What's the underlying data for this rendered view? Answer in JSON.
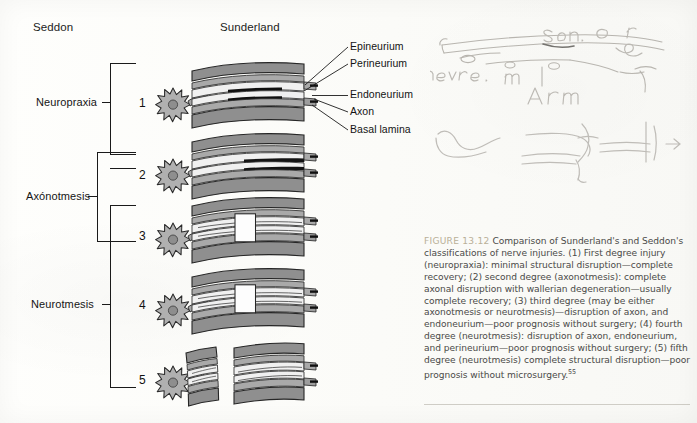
{
  "figure": {
    "headers": {
      "left": "Seddon",
      "right": "Sunderland"
    },
    "seddon_classes": [
      {
        "label": "Neuropraxia",
        "covers": "1"
      },
      {
        "label": "Axónotmesis",
        "covers": "2-3"
      },
      {
        "label": "Neurotmesis",
        "covers": "3-5"
      }
    ],
    "sunderland_degrees": [
      "1",
      "2",
      "3",
      "4",
      "5"
    ],
    "anatomy_labels": [
      "Epineurium",
      "Perineurium",
      "Endoneurium",
      "Axon",
      "Basal lamina"
    ],
    "caption": {
      "figure_number": "FIGURE 13.12",
      "text": "Comparison of Sunderland's and Seddon's classifications of nerve injuries. (1) First degree injury (neuropraxia): minimal structural disruption—complete recovery; (2) second degree (axonotmesis): complete axonal disruption with wallerian degeneration—usually complete recovery; (3) third degree (may be either axonotmesis or neurotmesis)—disruption of axon, and endoneurium—poor prognosis without surgery; (4) fourth degree (neurotmesis): disruption of axon, endoneurium, and perineurium—poor prognosis without surgery; (5) fifth degree (neurotmesis) complete structural disruption—poor prognosis without microsurgery.",
      "reference_superscript": "55"
    },
    "handwriting": {
      "note_1": "sen o r",
      "note_2": "nerve .  m",
      "note_3": "Arm"
    },
    "colors": {
      "epineurium_fill": "#8f8f8f",
      "perineurium_fill": "#b4b4b4",
      "endoneurium_fill": "#f2f2f2",
      "axon_dark": "#121212",
      "cell_body": "#9a9a9a",
      "ink": "#1a1a1a",
      "caption_text": "#4a4a48",
      "caption_figno": "#b9b097",
      "paper": "#fdfdfb"
    }
  }
}
